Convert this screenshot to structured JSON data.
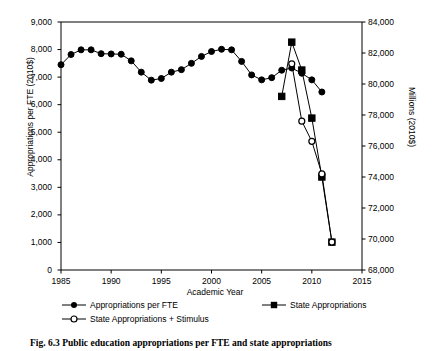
{
  "chart_data": {
    "type": "line",
    "title": "",
    "xlabel": "Academic Year",
    "ylabel": "Appropriations per FTE (2010$)",
    "y2label": "Millions (2010$)",
    "xlim": [
      1985,
      2015
    ],
    "ylim": [
      0,
      9000
    ],
    "y2lim": [
      68000,
      84000
    ],
    "grid": false,
    "legend_position": "below-axes",
    "xticks": [
      "1985",
      "1990",
      "1995",
      "2000",
      "2005",
      "2010",
      "2015"
    ],
    "xtick_values": [
      1985,
      1990,
      1995,
      2000,
      2005,
      2010,
      2015
    ],
    "yticks": [
      "0",
      "1,000",
      "2,000",
      "3,000",
      "4,000",
      "5,000",
      "6,000",
      "7,000",
      "8,000",
      "9,000"
    ],
    "ytick_values": [
      0,
      1000,
      2000,
      3000,
      4000,
      5000,
      6000,
      7000,
      8000,
      9000
    ],
    "y2ticks": [
      "68,000",
      "70,000",
      "72,000",
      "74,000",
      "76,000",
      "78,000",
      "80,000",
      "82,000",
      "84,000"
    ],
    "y2tick_values": [
      68000,
      70000,
      72000,
      74000,
      76000,
      78000,
      80000,
      82000,
      84000
    ],
    "series": [
      {
        "name": "Appropriations per FTE",
        "axis": "left",
        "marker": "filled-circle",
        "color": "#000000",
        "x": [
          1985,
          1986,
          1987,
          1988,
          1989,
          1990,
          1991,
          1992,
          1993,
          1994,
          1995,
          1996,
          1997,
          1998,
          1999,
          2000,
          2001,
          2002,
          2003,
          2004,
          2005,
          2006,
          2007,
          2008,
          2009,
          2010,
          2011
        ],
        "values": [
          7450,
          7820,
          7990,
          7990,
          7850,
          7840,
          7830,
          7590,
          7180,
          6890,
          6950,
          7180,
          7270,
          7500,
          7750,
          7930,
          8010,
          7990,
          7570,
          7080,
          6900,
          6980,
          7250,
          7330,
          7140,
          6900,
          6460
        ]
      },
      {
        "name": "State Appropriations",
        "axis": "right",
        "marker": "filled-square",
        "color": "#000000",
        "x": [
          2007,
          2008,
          2009,
          2010,
          2011,
          2012
        ],
        "values": [
          79200,
          82700,
          80900,
          77800,
          74000,
          69800
        ]
      },
      {
        "name": "State Appropriations + Stimulus",
        "axis": "right",
        "marker": "open-circle",
        "color": "#000000",
        "x": [
          2008,
          2009,
          2010,
          2011,
          2012
        ],
        "values": [
          81300,
          77600,
          76300,
          74200,
          69800
        ]
      }
    ]
  },
  "legend": {
    "entries": [
      {
        "label": "Appropriations per FTE",
        "marker": "filled-circle"
      },
      {
        "label": "State Appropriations",
        "marker": "filled-square"
      },
      {
        "label": "State Appropriations + Stimulus",
        "marker": "open-circle"
      }
    ]
  },
  "caption": {
    "text": "Fig. 6.3 Public education appropriations per FTE and state appropriations"
  }
}
